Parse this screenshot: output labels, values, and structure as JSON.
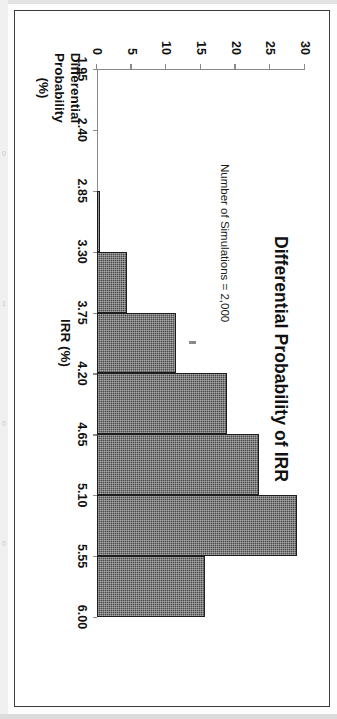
{
  "figure": {
    "title": "Differential Probability of IRR",
    "annotation": "Number of Simulations = 2,000",
    "x_axis_title": "IRR (%)",
    "y_axis_title_line1": "Differential",
    "y_axis_title_line2": "Probability",
    "y_axis_title_line3": "(%)"
  },
  "margin": {
    "bleed_text": "",
    "num_1": "0",
    "num_2": "1",
    "num_3": "0",
    "num_4": "0"
  },
  "chart_data": {
    "type": "bar",
    "title": "Differential Probability of IRR",
    "subtitle": "Number of Simulations = 2,000",
    "xlabel": "IRR (%)",
    "ylabel": "Differential Probability (%)",
    "orientation": "rotated-90-clockwise-on-page",
    "grid": false,
    "legend": null,
    "xlim": [
      1.95,
      6.0
    ],
    "ylim": [
      0,
      30
    ],
    "x_tick_labels": [
      "1.95",
      "2.40",
      "2.85",
      "3.30",
      "3.75",
      "4.20",
      "4.65",
      "5.10",
      "5.55",
      "6.00"
    ],
    "x_tick_values": [
      1.95,
      2.4,
      2.85,
      3.3,
      3.75,
      4.2,
      4.65,
      5.1,
      5.55,
      6.0
    ],
    "y_tick_labels": [
      "0",
      "5",
      "10",
      "15",
      "20",
      "25",
      "30"
    ],
    "y_tick_values": [
      0,
      5,
      10,
      15,
      20,
      25,
      30
    ],
    "bin_width": 0.45,
    "categories": [
      "2.85-3.30",
      "3.30-3.75",
      "3.75-4.20",
      "4.20-4.65",
      "4.65-5.10",
      "5.10-5.55",
      "5.55-6.00"
    ],
    "bins": [
      {
        "start": 2.85,
        "end": 3.3,
        "value": 0.5
      },
      {
        "start": 3.3,
        "end": 3.75,
        "value": 4.4
      },
      {
        "start": 3.75,
        "end": 4.2,
        "value": 11.4
      },
      {
        "start": 4.2,
        "end": 4.65,
        "value": 18.8
      },
      {
        "start": 4.65,
        "end": 5.1,
        "value": 23.3
      },
      {
        "start": 5.1,
        "end": 5.55,
        "value": 28.8
      },
      {
        "start": 5.55,
        "end": 6.0,
        "value": 15.6
      }
    ],
    "values": [
      0.5,
      4.4,
      11.4,
      18.8,
      23.3,
      28.8,
      15.6
    ]
  }
}
